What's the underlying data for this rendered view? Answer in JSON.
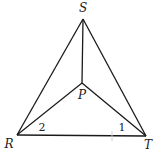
{
  "diagram": {
    "type": "geometry",
    "points": {
      "S": {
        "label": "S",
        "x": 83,
        "y": 19,
        "lx": 83,
        "ly": 12
      },
      "R": {
        "label": "R",
        "x": 17,
        "y": 135,
        "lx": 9,
        "ly": 148
      },
      "T": {
        "label": "T",
        "x": 146,
        "y": 136,
        "lx": 148,
        "ly": 149
      },
      "P": {
        "label": "P",
        "x": 82,
        "y": 83,
        "lx": 82,
        "ly": 99
      }
    },
    "segments": [
      [
        "S",
        "R"
      ],
      [
        "S",
        "T"
      ],
      [
        "R",
        "T"
      ],
      [
        "S",
        "P"
      ],
      [
        "R",
        "P"
      ],
      [
        "T",
        "P"
      ]
    ],
    "angle_labels": [
      {
        "label": "2",
        "x": 42,
        "y": 131
      },
      {
        "label": "1",
        "x": 122,
        "y": 131
      }
    ],
    "line_color": "#1a1a1a"
  }
}
